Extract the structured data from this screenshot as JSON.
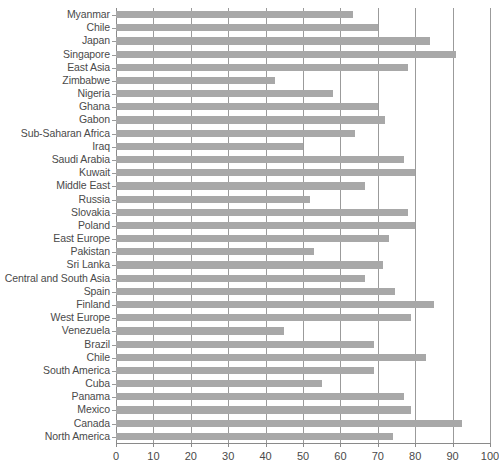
{
  "chart_data": {
    "type": "bar",
    "orientation": "horizontal",
    "title": "",
    "subtitle": "",
    "xlabel": "",
    "ylabel": "",
    "xlim": [
      0,
      100
    ],
    "ylim": null,
    "grid": true,
    "grid_axis": "x",
    "legend": false,
    "legend_position": "none",
    "bar_color": "#a8a8a8",
    "gridline_color": "#9b9b9b",
    "background_color": "#ffffff",
    "text_color": "#4a4a4a",
    "xticks": [
      0,
      10,
      20,
      30,
      40,
      50,
      60,
      70,
      80,
      90,
      100
    ],
    "xtick_labels": [
      "0",
      "10",
      "20",
      "30",
      "40",
      "50",
      "60",
      "70",
      "80",
      "90",
      "100"
    ],
    "categories": [
      "Myanmar",
      "Chile",
      "Japan",
      "Singapore",
      "East Asia",
      "Zimbabwe",
      "Nigeria",
      "Ghana",
      "Gabon",
      "Sub-Saharan Africa",
      "Iraq",
      "Saudi Arabia",
      "Kuwait",
      "Middle East",
      "Russia",
      "Slovakia",
      "Poland",
      "East Europe",
      "Pakistan",
      "Sri Lanka",
      "Central and South Asia",
      "Spain",
      "Finland",
      "West Europe",
      "Venezuela",
      "Brazil",
      "Chile",
      "South America",
      "Cuba",
      "Panama",
      "Mexico",
      "Canada",
      "North America"
    ],
    "values": [
      63.5,
      70.0,
      84.0,
      91.0,
      78.0,
      42.5,
      58.0,
      70.0,
      72.0,
      64.0,
      50.0,
      77.0,
      80.0,
      66.5,
      52.0,
      78.0,
      80.0,
      73.0,
      53.0,
      71.5,
      66.5,
      74.5,
      85.0,
      79.0,
      45.0,
      69.0,
      83.0,
      69.0,
      55.0,
      77.0,
      79.0,
      92.5,
      74.0
    ]
  }
}
